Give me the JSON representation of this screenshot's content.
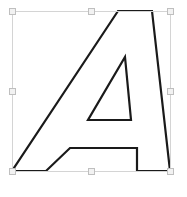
{
  "canvas": {
    "name": "vector-editor-canvas",
    "width": 187,
    "height": 197,
    "background_color": "#ffffff"
  },
  "shape": {
    "label": "A",
    "description": "Letter A glyph outline",
    "fill_color": "#ffffff",
    "stroke_color": "#1a1a1a",
    "stroke_width": 2.2,
    "outer_points": "152,11 170,171 137,171 137,148 70,148 46,171 12,171 118,11",
    "counter_points": "125,57 131,120 88,120"
  },
  "selection": {
    "label": "Selection bounding box",
    "box_color": "#d4d4d4",
    "handle_fill": "#f2f2f2",
    "handle_stroke": "#bfbfbf",
    "x": 12,
    "y": 11,
    "width": 158,
    "height": 160,
    "handles": [
      {
        "name": "handle-top-left",
        "cx": 12,
        "cy": 11
      },
      {
        "name": "handle-top-center",
        "cx": 91,
        "cy": 11
      },
      {
        "name": "handle-top-right",
        "cx": 170,
        "cy": 11
      },
      {
        "name": "handle-middle-left",
        "cx": 12,
        "cy": 91
      },
      {
        "name": "handle-middle-right",
        "cx": 170,
        "cy": 91
      },
      {
        "name": "handle-bottom-left",
        "cx": 12,
        "cy": 171
      },
      {
        "name": "handle-bottom-center",
        "cx": 91,
        "cy": 171
      },
      {
        "name": "handle-bottom-right",
        "cx": 170,
        "cy": 171
      }
    ]
  }
}
